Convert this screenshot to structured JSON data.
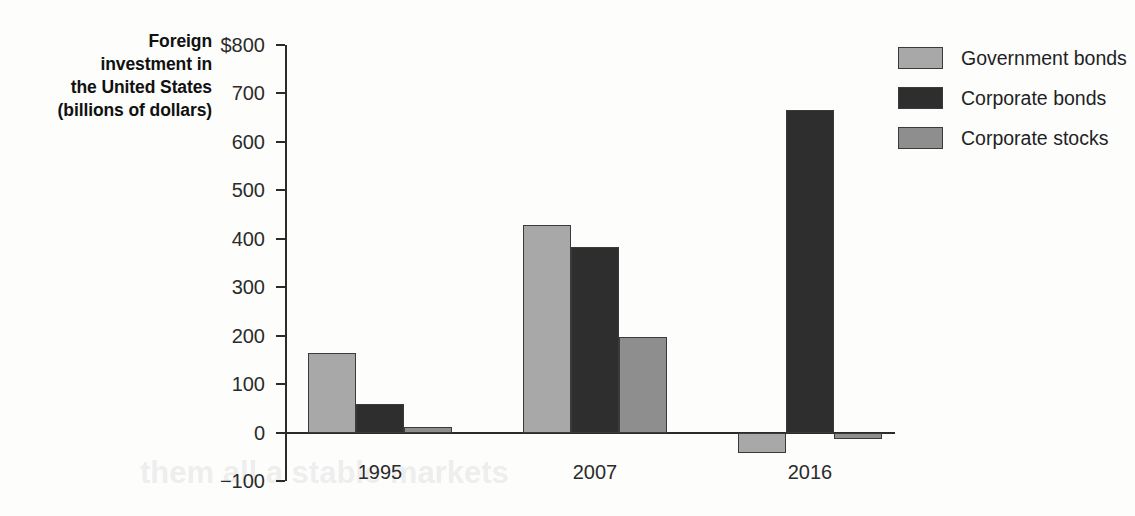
{
  "chart_data": {
    "type": "bar",
    "title": "",
    "ylabel": "Foreign investment in the United States (billions of dollars)",
    "xlabel": "",
    "categories": [
      "1995",
      "2007",
      "2016"
    ],
    "series": [
      {
        "name": "Government bonds",
        "color": "#a8a8a8",
        "values": [
          165,
          428,
          -43
        ]
      },
      {
        "name": "Corporate bonds",
        "color": "#2e2e2e",
        "values": [
          58,
          384,
          665
        ]
      },
      {
        "name": "Corporate stocks",
        "color": "#8e8e8e",
        "values": [
          12,
          198,
          -13
        ]
      }
    ],
    "ylim": [
      -100,
      800
    ],
    "yticks": [
      800,
      700,
      600,
      500,
      400,
      300,
      200,
      100,
      0,
      -100
    ],
    "ytick_labels": [
      "$800",
      "700",
      "600",
      "500",
      "400",
      "300",
      "200",
      "100",
      "0",
      "−100"
    ],
    "grid": false,
    "legend_position": "right"
  },
  "y_axis": {
    "title_lines": [
      "Foreign",
      "investment in",
      "the United States",
      "(billions of dollars)"
    ]
  },
  "legend": {
    "items": [
      {
        "label": "Government bonds"
      },
      {
        "label": "Corporate bonds"
      },
      {
        "label": "Corporate stocks"
      }
    ]
  },
  "ghost_text": {
    "line1": "them all a stable markets"
  }
}
